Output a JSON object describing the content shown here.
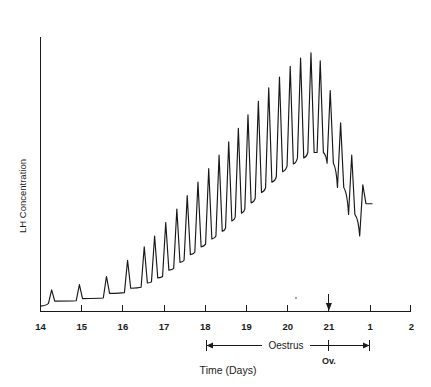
{
  "chart_data": {
    "type": "line",
    "title": "",
    "subtitle": "",
    "xlabel": "Time (Days)",
    "ylabel": "LH Concentration",
    "grid": false,
    "legend": null,
    "legend_position": "none",
    "xlim": [
      14,
      24
    ],
    "ylim": [
      0,
      100
    ],
    "x_tick_labels": [
      "14",
      "15",
      "16",
      "17",
      "18",
      "19",
      "20",
      "21",
      "1",
      "2"
    ],
    "x_tick_values": [
      14,
      15,
      16,
      17,
      18,
      19,
      20,
      21,
      22,
      23
    ],
    "y_tick_labels": [],
    "annotations": [
      {
        "name": "oestrus-span",
        "label": "Oestrus",
        "start_day": 18,
        "end_day": 22,
        "marker_day": 21
      },
      {
        "name": "ovulation-marker",
        "label": "Ov.",
        "day": 21
      }
    ],
    "series": [
      {
        "name": "LH Concentration",
        "description": "Pulsatile LH secretion rising to a preovulatory surge then declining",
        "color": "#181818",
        "pulses": [
          {
            "x": 14.3,
            "baseline": 3,
            "peak": 8
          },
          {
            "x": 15.05,
            "baseline": 4,
            "peak": 10
          },
          {
            "x": 15.78,
            "baseline": 5,
            "peak": 13
          },
          {
            "x": 16.35,
            "baseline": 7,
            "peak": 19
          },
          {
            "x": 16.8,
            "baseline": 9,
            "peak": 24
          },
          {
            "x": 17.08,
            "baseline": 11,
            "peak": 28
          },
          {
            "x": 17.38,
            "baseline": 13,
            "peak": 33
          },
          {
            "x": 17.68,
            "baseline": 16,
            "peak": 38
          },
          {
            "x": 17.96,
            "baseline": 19,
            "peak": 43
          },
          {
            "x": 18.25,
            "baseline": 22,
            "peak": 48
          },
          {
            "x": 18.54,
            "baseline": 25,
            "peak": 53
          },
          {
            "x": 18.82,
            "baseline": 28,
            "peak": 58
          },
          {
            "x": 19.08,
            "baseline": 31,
            "peak": 63
          },
          {
            "x": 19.34,
            "baseline": 35,
            "peak": 68
          },
          {
            "x": 19.6,
            "baseline": 38,
            "peak": 73
          },
          {
            "x": 19.88,
            "baseline": 42,
            "peak": 78
          },
          {
            "x": 20.16,
            "baseline": 46,
            "peak": 83
          },
          {
            "x": 20.45,
            "baseline": 50,
            "peak": 87
          },
          {
            "x": 20.74,
            "baseline": 54,
            "peak": 91
          },
          {
            "x": 21.02,
            "baseline": 57,
            "peak": 94
          },
          {
            "x": 21.3,
            "baseline": 59,
            "peak": 96
          },
          {
            "x": 21.55,
            "baseline": 59,
            "peak": 93
          },
          {
            "x": 21.82,
            "baseline": 55,
            "peak": 82
          },
          {
            "x": 22.1,
            "baseline": 46,
            "peak": 70
          },
          {
            "x": 22.4,
            "baseline": 36,
            "peak": 58
          },
          {
            "x": 22.7,
            "baseline": 28,
            "peak": 47
          }
        ],
        "start": {
          "x": 14.0,
          "y": 2
        },
        "end": {
          "x": 22.95,
          "y": 40
        }
      }
    ]
  },
  "axes": {
    "y_axis_label": "LH Concentration",
    "x_axis_label": "Time (Days)"
  },
  "markers": {
    "oestrus_label": "Oestrus",
    "ovulation_label": "Ov."
  }
}
